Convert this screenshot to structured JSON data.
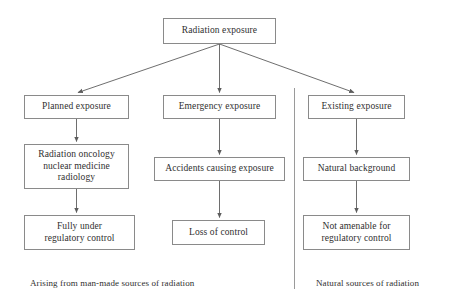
{
  "diagram": {
    "background_color": "#ffffff",
    "line_color": "#6b6b6b",
    "box_border_color": "#8a8a8a",
    "text_color": "#2f2f2f",
    "nodes": {
      "root": "Radiation exposure",
      "planned": "Planned exposure",
      "emergency": "Emergency exposure",
      "existing": "Existing exposure",
      "radiation_oncology": "Radiation oncology\nnuclear medicine\nradiology",
      "accidents": "Accidents causing exposure",
      "natural_background": "Natural background",
      "fully_under": "Fully under\nregulatory control",
      "loss_of_control": "Loss of control",
      "not_amenable": "Not amenable for\nregulatory control"
    },
    "captions": {
      "left": "Arising from man-made sources of radiation",
      "right": "Natural sources of radiation"
    }
  }
}
